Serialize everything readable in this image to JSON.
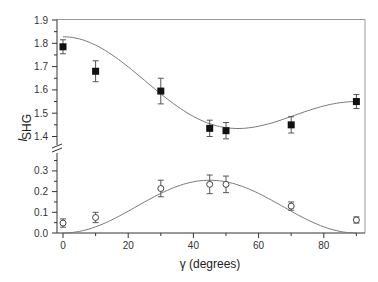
{
  "chart_data": {
    "type": "scatter",
    "title": "",
    "xlabel": "γ (degrees)",
    "ylabel": "I",
    "ylabel_subscript": "SHG",
    "xlim": [
      -2,
      92
    ],
    "x_ticks": [
      0,
      20,
      40,
      60,
      80
    ],
    "broken_y_axis": true,
    "panels": [
      {
        "name": "upper",
        "ylim": [
          1.37,
          1.9
        ],
        "y_ticks": [
          1.4,
          1.5,
          1.6,
          1.7,
          1.8,
          1.9
        ],
        "y_tick_labels": [
          "1.4",
          "1.5",
          "1.6",
          "1.7",
          "1.8",
          "1.9"
        ],
        "series": [
          {
            "name": "upper-data",
            "marker": "filled-square",
            "x": [
              0,
              10,
              30,
              45,
              50,
              70,
              90
            ],
            "y": [
              1.785,
              1.68,
              1.595,
              1.435,
              1.425,
              1.45,
              1.55
            ],
            "yerr": [
              0.03,
              0.045,
              0.055,
              0.035,
              0.035,
              0.035,
              0.03
            ]
          },
          {
            "name": "upper-fit",
            "style": "line",
            "model": "a + b*cos(2γ) + c*cos(4γ)",
            "x": [
              0,
              10,
              20,
              30,
              40,
              45,
              50,
              55,
              60,
              70,
              80,
              90
            ],
            "y": [
              1.828,
              1.805,
              1.74,
              1.635,
              1.5,
              1.455,
              1.425,
              1.415,
              1.42,
              1.46,
              1.52,
              1.55
            ]
          }
        ]
      },
      {
        "name": "lower",
        "ylim": [
          0.0,
          0.37
        ],
        "y_ticks": [
          0.0,
          0.1,
          0.2,
          0.3
        ],
        "y_tick_labels": [
          "0.0",
          "0.1",
          "0.2",
          "0.3"
        ],
        "series": [
          {
            "name": "lower-data",
            "marker": "open-circle",
            "x": [
              0,
              10,
              30,
              45,
              50,
              70,
              90
            ],
            "y": [
              0.048,
              0.075,
              0.215,
              0.235,
              0.235,
              0.13,
              0.063
            ],
            "yerr": [
              0.02,
              0.025,
              0.04,
              0.045,
              0.04,
              0.02,
              0.015
            ]
          },
          {
            "name": "lower-fit",
            "style": "line",
            "model": "A*sin^2(2γ)",
            "amplitude": 0.255
          }
        ]
      }
    ]
  },
  "labels": {
    "xlabel": "γ (degrees)",
    "ylabel_main": "I",
    "ylabel_sub": "SHG"
  }
}
